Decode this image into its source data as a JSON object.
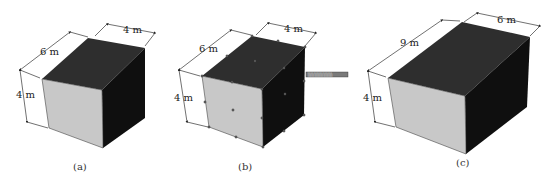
{
  "figures": [
    {
      "id": "a",
      "caption": "(a)",
      "dimensions": {
        "length": "6 m",
        "width": "4 m",
        "height": "4 m"
      }
    },
    {
      "id": "b",
      "caption": "(b)",
      "dimensions": {
        "length": "6 m",
        "width": "4 m",
        "height": "4 m"
      },
      "selected": true,
      "tooltip": "░░░░░░░░"
    },
    {
      "id": "c",
      "caption": "(c)",
      "dimensions": {
        "length": "9 m",
        "width": "6 m",
        "height": "4 m"
      }
    }
  ],
  "colors": {
    "top_face": "#2e2e2e",
    "right_face": "#101010",
    "front_face": "#c8c8c8",
    "grip": "#555555",
    "tooltip_bg": "#7a7a7a"
  }
}
